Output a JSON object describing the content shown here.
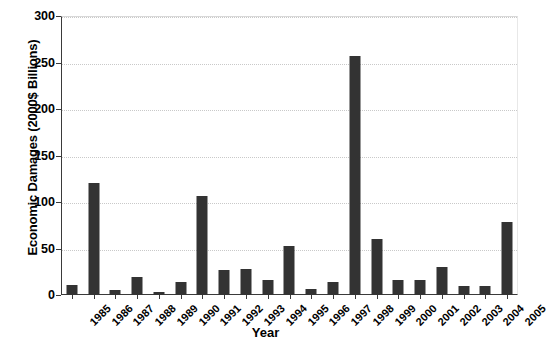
{
  "chart_data": {
    "type": "bar",
    "title": "",
    "xlabel": "Year",
    "ylabel": "Economic Damages (2000$ Billions)",
    "categories": [
      "1985",
      "1986",
      "1987",
      "1988",
      "1989",
      "1990",
      "1991",
      "1992",
      "1993",
      "1994",
      "1995",
      "1996",
      "1997",
      "1998",
      "1999",
      "2000",
      "2001",
      "2002",
      "2003",
      "2004",
      "2005"
    ],
    "values": [
      11,
      120,
      5,
      19,
      3,
      14,
      106,
      27,
      28,
      16,
      53,
      6,
      14,
      257,
      60,
      16,
      16,
      30,
      10,
      10,
      78
    ],
    "ylim": [
      0,
      300
    ],
    "yticks": [
      0,
      50,
      100,
      150,
      200,
      250,
      300
    ],
    "ytick_labels": [
      "0",
      "50",
      "100",
      "150",
      "200",
      "250",
      "300"
    ],
    "grid": true,
    "grid_axis": "y",
    "legend": false,
    "legend_position": "none",
    "bar_color": "#333333",
    "grid_color": "#c9c9c9",
    "axis_color": "#3a3a3a",
    "background_color": "#ffffff",
    "xtick_label_rotation": -45
  }
}
